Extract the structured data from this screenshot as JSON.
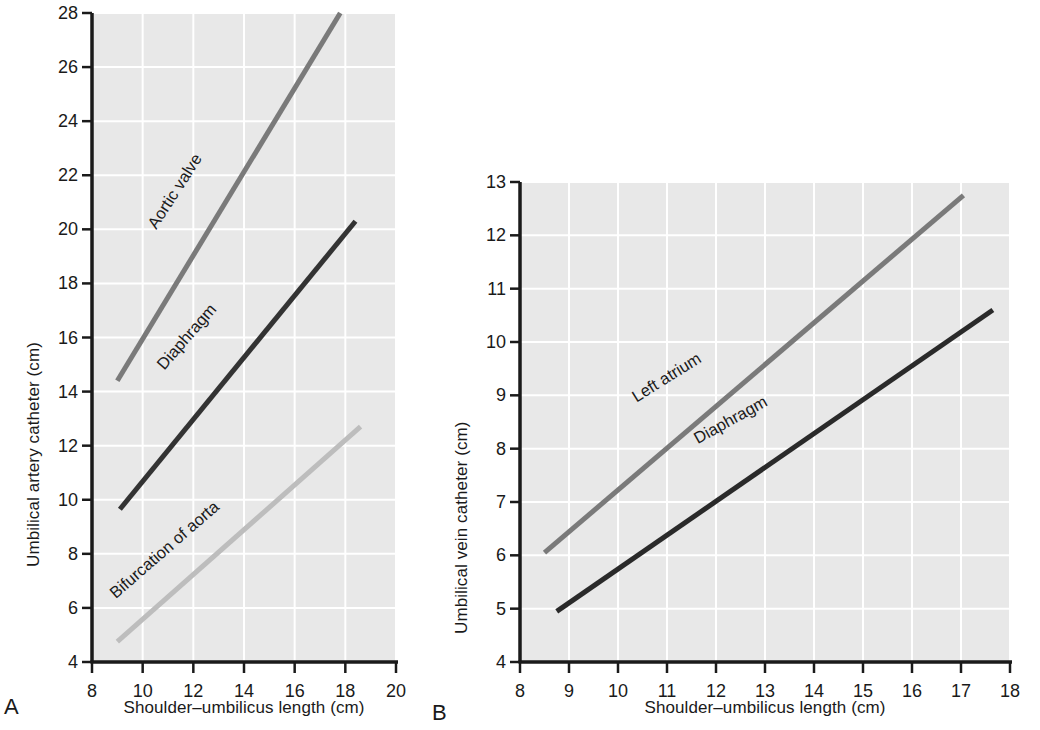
{
  "figure": {
    "background": "#ffffff",
    "plot_background": "#e8e8e8",
    "gridline_color": "#ffffff",
    "axis_color": "#1a1a1a"
  },
  "panels": [
    {
      "letter": "A",
      "xlabel": "Shoulder–umbilicus length (cm)",
      "ylabel": "Umbilical artery catheter (cm)"
    },
    {
      "letter": "B",
      "xlabel": "Shoulder–umbilicus length (cm)",
      "ylabel": "Umbilical vein catheter (cm)"
    }
  ],
  "chart_data": [
    {
      "type": "line",
      "title": "",
      "panel": "A",
      "xlabel": "Shoulder–umbilicus length (cm)",
      "ylabel": "Umbilical artery catheter (cm)",
      "xlim": [
        8,
        20
      ],
      "ylim": [
        4,
        28
      ],
      "xticks": [
        8,
        10,
        12,
        14,
        16,
        18,
        20
      ],
      "xtick_labels": [
        "8",
        "10",
        "12",
        "14",
        "16",
        "18",
        "20"
      ],
      "yticks": [
        4,
        6,
        8,
        10,
        12,
        14,
        16,
        18,
        20,
        22,
        24,
        26,
        28
      ],
      "ytick_labels": [
        "4",
        "6",
        "8",
        "10",
        "12",
        "14",
        "16",
        "18",
        "20",
        "22",
        "24",
        "26",
        "28"
      ],
      "grid": true,
      "legend": "inline-labels",
      "series": [
        {
          "name": "Aortic valve",
          "color": "#7a7a7a",
          "width": 5,
          "x": [
            9.0,
            17.8
          ],
          "y": [
            14.4,
            28.0
          ],
          "label_x": 11.45,
          "label_y": 21.3,
          "label_rotation": -57
        },
        {
          "name": "Diaphragm",
          "color": "#333333",
          "width": 5,
          "x": [
            9.1,
            18.4
          ],
          "y": [
            9.65,
            20.3
          ],
          "label_x": 11.9,
          "label_y": 15.9,
          "label_rotation": -49
        },
        {
          "name": "Bifurcation of aorta",
          "color": "#bdbdbd",
          "width": 5,
          "x": [
            9.0,
            18.6
          ],
          "y": [
            4.75,
            12.7
          ],
          "label_x": 11.0,
          "label_y": 8.0,
          "label_rotation": -41
        }
      ]
    },
    {
      "type": "line",
      "title": "",
      "panel": "B",
      "xlabel": "Shoulder–umbilicus length (cm)",
      "ylabel": "Umbilical vein catheter (cm)",
      "xlim": [
        8,
        18
      ],
      "ylim": [
        4,
        13
      ],
      "xticks": [
        8,
        9,
        10,
        11,
        12,
        13,
        14,
        15,
        16,
        17,
        18
      ],
      "xtick_labels": [
        "8",
        "9",
        "10",
        "11",
        "12",
        "13",
        "14",
        "15",
        "16",
        "17",
        "18"
      ],
      "yticks": [
        4,
        5,
        6,
        7,
        8,
        9,
        10,
        11,
        12,
        13
      ],
      "ytick_labels": [
        "4",
        "5",
        "6",
        "7",
        "8",
        "9",
        "10",
        "11",
        "12",
        "13"
      ],
      "grid": true,
      "legend": "inline-labels",
      "series": [
        {
          "name": "Left atrium",
          "color": "#7a7a7a",
          "width": 5,
          "x": [
            8.5,
            17.05
          ],
          "y": [
            6.05,
            12.75
          ],
          "label_x": 11.05,
          "label_y": 9.25,
          "label_rotation": -32
        },
        {
          "name": "Diaphragm",
          "color": "#2a2a2a",
          "width": 5,
          "x": [
            8.75,
            17.65
          ],
          "y": [
            4.95,
            10.6
          ],
          "label_x": 12.35,
          "label_y": 8.45,
          "label_rotation": -29
        }
      ]
    }
  ]
}
